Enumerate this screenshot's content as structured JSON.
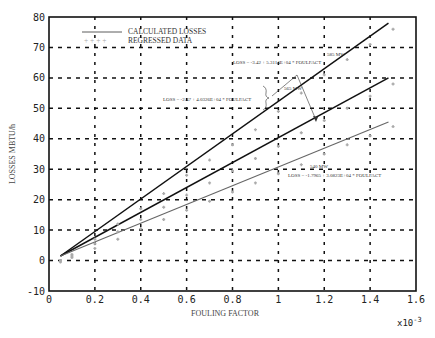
{
  "chart_data": {
    "type": "line",
    "title": "",
    "xlabel": "FOULING FACTOR",
    "ylabel": "LOSSES MBTU/h",
    "x_multiplier": "x10-3",
    "xlim": [
      0,
      1.6
    ],
    "ylim": [
      -10,
      80
    ],
    "x_ticks": [
      "0",
      "0.2",
      "0.4",
      "0.6",
      "0.8",
      "1",
      "1.2",
      "1.4",
      "1.6"
    ],
    "y_ticks": [
      "-10",
      "0",
      "10",
      "20",
      "30",
      "40",
      "50",
      "60",
      "70",
      "80"
    ],
    "grid": true,
    "legend": {
      "position": "upper-left",
      "entries": [
        "CALCULATED LOSSES",
        "REGRESSED DATA"
      ]
    },
    "series": [
      {
        "name": "585 MW",
        "equation": "LOSS = -3.42 + 5.3114E+04 * FOULFACT",
        "x": [
          0.05,
          1.48
        ],
        "y": [
          1.5,
          78
        ],
        "style": "solid-dark"
      },
      {
        "name": "565 MW",
        "equation": "LOSS = -2.47 + 4.0326E+04 * FOULFACT",
        "x": [
          0.05,
          1.48
        ],
        "y": [
          1.5,
          60
        ],
        "style": "solid-dark"
      },
      {
        "name": "540 MW",
        "equation": "LOSS = -1.7965 + 3.0823E+04 * FOULFACT",
        "x": [
          0.05,
          1.48
        ],
        "y": [
          1.5,
          45.5
        ],
        "style": "solid-gray"
      }
    ],
    "regressed_points": {
      "585 MW": [
        [
          0.05,
          0
        ],
        [
          0.1,
          2
        ],
        [
          0.2,
          7
        ],
        [
          0.3,
          12
        ],
        [
          0.4,
          17
        ],
        [
          0.5,
          22
        ],
        [
          0.6,
          28
        ],
        [
          0.7,
          33
        ],
        [
          0.8,
          38
        ],
        [
          0.9,
          43
        ],
        [
          1.0,
          49
        ],
        [
          1.1,
          55
        ],
        [
          1.2,
          61
        ],
        [
          1.3,
          66
        ],
        [
          1.4,
          71
        ],
        [
          1.5,
          76
        ]
      ],
      "565 MW": [
        [
          0.05,
          0
        ],
        [
          0.1,
          1.5
        ],
        [
          0.2,
          5.5
        ],
        [
          0.3,
          9.5
        ],
        [
          0.4,
          13.5
        ],
        [
          0.5,
          17.5
        ],
        [
          0.6,
          21.5
        ],
        [
          0.7,
          25.5
        ],
        [
          0.8,
          29.5
        ],
        [
          0.9,
          33.5
        ],
        [
          1.0,
          37.5
        ],
        [
          1.1,
          42
        ],
        [
          1.2,
          46
        ],
        [
          1.3,
          50
        ],
        [
          1.4,
          54
        ],
        [
          1.5,
          58
        ]
      ],
      "540 MW": [
        [
          0.05,
          -0.5
        ],
        [
          0.1,
          1
        ],
        [
          0.2,
          4
        ],
        [
          0.3,
          7
        ],
        [
          0.4,
          10.5
        ],
        [
          0.5,
          13.5
        ],
        [
          0.6,
          16.5
        ],
        [
          0.7,
          19.5
        ],
        [
          0.8,
          22.5
        ],
        [
          0.9,
          25.5
        ],
        [
          1.0,
          28.5
        ],
        [
          1.1,
          31.5
        ],
        [
          1.2,
          35
        ],
        [
          1.3,
          38
        ],
        [
          1.4,
          41
        ],
        [
          1.5,
          44
        ]
      ]
    }
  },
  "annotations": {
    "top_label": "585 MW",
    "top_eq": "LOSS = -3.42 + 5.3114E+04 * FOULFACT",
    "mid_label": "565 MW",
    "mid_eq": "LOSS = -2.47 + 4.0326E+04 * FOULFACT",
    "low_label": "540 MW",
    "low_eq": "LOSS = -1.7965 + 3.0823E+04 * FOULFACT"
  },
  "legend": {
    "calculated": "CALCULATED LOSSES",
    "regressed": "REGRESSED DATA"
  }
}
